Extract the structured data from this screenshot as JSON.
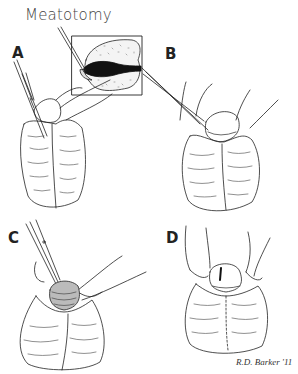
{
  "figure": {
    "title": "Meatotomy",
    "panels": [
      {
        "label": "A",
        "description": "Clamp applied to ventral meatus"
      },
      {
        "label": "B",
        "description": "Scissors cutting crushed tissue"
      },
      {
        "label": "C",
        "description": "Scissors incision completion"
      },
      {
        "label": "D",
        "description": "Result after meatotomy"
      }
    ],
    "inset": {
      "description": "Cross-section of glans showing instrument in meatus"
    },
    "signature": "R.D. Barker '11"
  },
  "colors": {
    "line": "#222222",
    "background": "#ffffff",
    "fill_dark": "#111111"
  }
}
